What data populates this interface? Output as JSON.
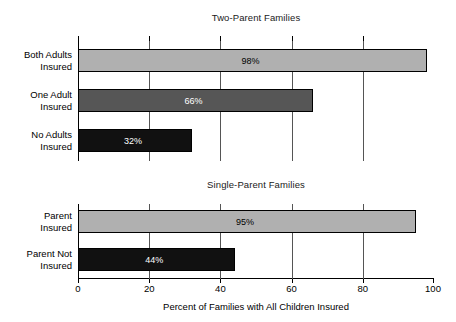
{
  "chart_data": {
    "type": "bar",
    "orientation": "horizontal",
    "title": "",
    "xlabel": "Percent of Families with All Children Insured",
    "ylabel": "",
    "xlim": [
      0,
      100
    ],
    "xticks": [
      0,
      20,
      40,
      60,
      80,
      100
    ],
    "xticklabels": [
      "0",
      "20",
      "40",
      "60",
      "80",
      "100"
    ],
    "grid": true,
    "grid_axis": "x",
    "legend": "none",
    "panels": [
      {
        "title": "Two-Parent Families",
        "categories": [
          "Both Adults Insured",
          "One Adult Insured",
          "No Adults Insured"
        ],
        "category_lines": [
          [
            "Both Adults",
            "Insured"
          ],
          [
            "One Adult",
            "Insured"
          ],
          [
            "No Adults",
            "Insured"
          ]
        ],
        "values": [
          98,
          66,
          32
        ],
        "value_labels": [
          "98%",
          "66%",
          "32%"
        ],
        "bar_colors": [
          "#b0b0b0",
          "#565656",
          "#111111"
        ],
        "label_colors": [
          "#000000",
          "#ffffff",
          "#ffffff"
        ]
      },
      {
        "title": "Single-Parent Families",
        "categories": [
          "Parent Insured",
          "Parent Not Insured"
        ],
        "category_lines": [
          [
            "Parent",
            "Insured"
          ],
          [
            "Parent Not",
            "Insured"
          ]
        ],
        "values": [
          95,
          44
        ],
        "value_labels": [
          "95%",
          "44%"
        ],
        "bar_colors": [
          "#b0b0b0",
          "#111111"
        ],
        "label_colors": [
          "#000000",
          "#ffffff"
        ]
      }
    ]
  }
}
